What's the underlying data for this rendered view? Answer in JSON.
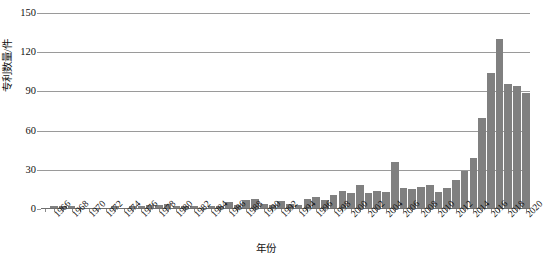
{
  "chart_data": {
    "type": "bar",
    "title": "",
    "subtitle": "",
    "xlabel": "年份",
    "ylabel": "专利数量/件",
    "ylim": [
      0,
      150
    ],
    "yticks": [
      0,
      30,
      60,
      90,
      120,
      150
    ],
    "ytick_labels": [
      "0",
      "30",
      "60",
      "90",
      "120",
      "150"
    ],
    "grid": "horizontal",
    "legend": "none",
    "bar_color": "#808080",
    "axis_color": "#9a9a9a",
    "text_color": "#111111",
    "background": "#ffffff",
    "xtick_step_years": 2,
    "xtick_labels": [
      "1966",
      "1968",
      "1970",
      "1972",
      "1974",
      "1976",
      "1978",
      "1980",
      "1982",
      "1984",
      "1986",
      "1988",
      "1990",
      "1992",
      "1994",
      "1996",
      "1998",
      "2000",
      "2002",
      "2004",
      "2006",
      "2008",
      "2010",
      "2012",
      "2014",
      "2016",
      "2018",
      "2020"
    ],
    "categories": [
      "1965",
      "1966",
      "1967",
      "1968",
      "1969",
      "1970",
      "1971",
      "1972",
      "1973",
      "1974",
      "1975",
      "1976",
      "1977",
      "1978",
      "1979",
      "1980",
      "1981",
      "1982",
      "1983",
      "1984",
      "1985",
      "1986",
      "1987",
      "1988",
      "1989",
      "1990",
      "1991",
      "1992",
      "1993",
      "1994",
      "1995",
      "1996",
      "1997",
      "1998",
      "1999",
      "2000",
      "2001",
      "2002",
      "2003",
      "2004",
      "2005",
      "2006",
      "2007",
      "2008",
      "2009",
      "2010",
      "2011",
      "2012",
      "2013",
      "2014",
      "2015",
      "2016",
      "2017",
      "2018",
      "2019",
      "2020"
    ],
    "values": [
      1,
      2,
      2,
      2,
      1,
      1,
      0,
      1,
      2,
      1,
      2,
      2,
      3,
      3,
      4,
      2,
      2,
      2,
      1,
      2,
      2,
      5,
      3,
      7,
      8,
      4,
      3,
      6,
      4,
      3,
      8,
      9,
      7,
      11,
      14,
      12,
      18,
      12,
      14,
      13,
      36,
      16,
      15,
      17,
      18,
      13,
      16,
      22,
      29,
      39,
      70,
      104,
      130,
      96,
      94,
      89
    ],
    "series_name": "专利数量"
  }
}
